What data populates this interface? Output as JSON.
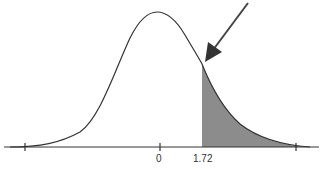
{
  "figure": {
    "type": "normal-distribution-diagram",
    "axis": {
      "tick_labels": [
        "0",
        "1.72"
      ]
    },
    "shaded_region": {
      "from": "1.72",
      "to": "+inf",
      "color": "#8c8c8c"
    },
    "curve_color": "#333333",
    "arrow_color": "#444444"
  }
}
